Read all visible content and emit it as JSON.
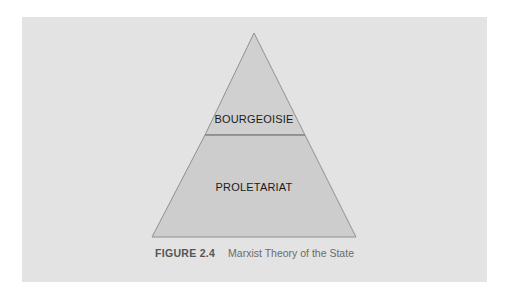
{
  "figure": {
    "number": "FIGURE 2.4",
    "title": "Marxist Theory of the State"
  },
  "pyramid": {
    "levels": [
      {
        "label": "BOURGEOISIE",
        "position": "top"
      },
      {
        "label": "PROLETARIAT",
        "position": "bottom"
      }
    ],
    "colors": {
      "background": "#e3e3e3",
      "fill": "#cfcfcf",
      "stroke": "#8f8f8f"
    }
  }
}
